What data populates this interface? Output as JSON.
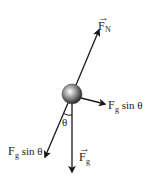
{
  "diagram": {
    "colors": {
      "stroke": "#1a1a1a",
      "background": "#ffffff",
      "ball_light": "#ffffff",
      "ball_dark": "#222222"
    },
    "ball": {
      "cx": 72,
      "cy": 94,
      "r": 10
    },
    "forces": [
      {
        "id": "normal",
        "label_main": "F",
        "label_sub": "N",
        "vector": true,
        "x1": 76,
        "y1": 85,
        "x2": 99,
        "y2": 30,
        "lx": 98,
        "ly": 17
      },
      {
        "id": "parallel_component",
        "label_main": "F",
        "label_sub": "g",
        "suffix": " sin θ",
        "vector": false,
        "x1": 81,
        "y1": 98,
        "x2": 105,
        "y2": 104,
        "lx": 109,
        "ly": 110
      },
      {
        "id": "gravity",
        "label_main": "F",
        "label_sub": "g",
        "vector": true,
        "x1": 72,
        "y1": 104,
        "x2": 72,
        "y2": 172,
        "lx": 79,
        "ly": 163
      },
      {
        "id": "perpendicular_component",
        "label_main": "F",
        "label_sub": "g",
        "suffix": " sin θ",
        "vector": false,
        "x1": 68,
        "y1": 103,
        "x2": 45,
        "y2": 157,
        "lx": 5,
        "ly": 156
      }
    ],
    "angle": {
      "label": "θ",
      "lx": 63,
      "ly": 127
    }
  }
}
